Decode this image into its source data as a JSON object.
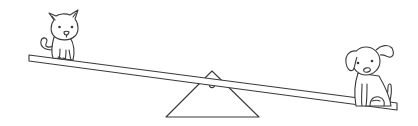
{
  "scene": {
    "description": "Line-art illustration of a seesaw with a cat on the raised left end and a dog on the lowered right end",
    "background_color": "#ffffff",
    "line_color": "#3a3a3a",
    "left_figure": "cat",
    "right_figure": "dog",
    "fulcrum": "triangle",
    "tilt": "right side down"
  }
}
